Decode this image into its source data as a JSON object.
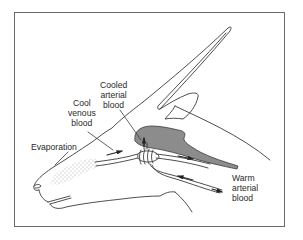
{
  "diagram": {
    "colors": {
      "line": "#3a3a3a",
      "brain_fill": "#8c8c8c",
      "frame": "#6a6a6a",
      "background": "#ffffff"
    },
    "labels": {
      "cooled_arterial": "Cooled\narterial\nblood",
      "cool_venous": "Cool\nvenous\nblood",
      "evaporation": "Evaporation",
      "warm_arterial": "Warm\narterial\nblood"
    },
    "structures": [
      {
        "name": "horn"
      },
      {
        "name": "ear"
      },
      {
        "name": "brain",
        "shading": "gray"
      },
      {
        "name": "carotid-rete"
      },
      {
        "name": "nasal-evaporative-surface",
        "pattern": "stippled"
      },
      {
        "name": "vein-from-nose"
      },
      {
        "name": "carotid-artery"
      }
    ],
    "arrows": [
      {
        "id": "venous-flow-to-rete",
        "direction": "right"
      },
      {
        "id": "cooled-blood-to-brain",
        "direction": "up"
      },
      {
        "id": "venous-flow-out",
        "direction": "right"
      },
      {
        "id": "arterial-flow-in",
        "direction": "left"
      },
      {
        "id": "warm-arterial-entry",
        "direction": "right"
      }
    ]
  }
}
